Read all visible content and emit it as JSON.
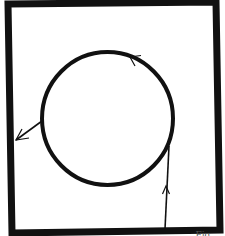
{
  "diagram": {
    "type": "trajectory-in-box",
    "frame": {
      "corners": [
        [
          8,
          4
        ],
        [
          216,
          2
        ],
        [
          220,
          230
        ],
        [
          12,
          233
        ]
      ],
      "stroke_width": 7,
      "color": "#111111"
    },
    "circle": {
      "cx": 107.5,
      "cy": 118.5,
      "rx": 65.5,
      "ry": 66.5,
      "stroke_width": 4,
      "color": "#111111",
      "direction": "counter-clockwise"
    },
    "entry_line": {
      "from": [
        165,
        229
      ],
      "to": [
        169,
        146
      ],
      "arrow_at": [
        166,
        188
      ],
      "arrow_direction": "up"
    },
    "top_arrow": {
      "at": [
        130,
        57
      ],
      "arrow_direction": "left"
    },
    "exit_line": {
      "from": [
        42,
        121
      ],
      "to": [
        15,
        140
      ],
      "arrow_direction": "down-left"
    },
    "background": "#ffffff"
  },
  "caption": {
    "text": "… Fig. …"
  }
}
